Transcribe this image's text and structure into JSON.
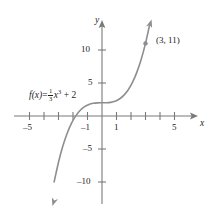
{
  "chart_data": {
    "type": "line",
    "title": "",
    "function_label": "f(x) = 1/3 x^3 + 2",
    "equation_parts": {
      "fx": "f(x)",
      "equals": "=",
      "numerator": "1",
      "denominator": "3",
      "variable": "x",
      "exponent": "3",
      "plus_constant": "+ 2"
    },
    "xlabel": "x",
    "ylabel": "y",
    "xlim": [
      -5.9,
      5.9
    ],
    "ylim": [
      -13.5,
      13.5
    ],
    "x_tick_values": [
      -5,
      -4,
      -3,
      -2,
      -1,
      1,
      2,
      3,
      4,
      5
    ],
    "x_tick_labels": [
      {
        "value": -5,
        "text": "–5"
      },
      {
        "value": -1,
        "text": "–1"
      },
      {
        "value": 1,
        "text": "1"
      },
      {
        "value": 5,
        "text": "5"
      }
    ],
    "y_tick_values": [
      -10,
      -5,
      5,
      10
    ],
    "y_tick_labels": [
      {
        "value": 10,
        "text": "10"
      },
      {
        "value": 5,
        "text": "5"
      },
      {
        "value": -5,
        "text": "–5"
      },
      {
        "value": -10,
        "text": "–10"
      }
    ],
    "grid": false,
    "legend": "none",
    "curve_color": "#8e8e8e",
    "axis_color": "#7a7a7a",
    "text_color": "#1d1d1d",
    "annotations": [
      {
        "name": "marked-point",
        "x": 3,
        "y": 11,
        "text": "(3, 11)",
        "marker": "dot"
      }
    ],
    "x": [
      -3.3,
      -3.0,
      -2.7,
      -2.4,
      -2.1,
      -1.8,
      -1.5,
      -1.2,
      -0.9,
      -0.6,
      -0.3,
      0.0,
      0.3,
      0.6,
      0.9,
      1.2,
      1.5,
      1.8,
      2.1,
      2.4,
      2.7,
      3.0,
      3.3
    ],
    "y": [
      -9.98,
      -7.0,
      -4.56,
      -2.61,
      -1.09,
      0.06,
      0.88,
      1.42,
      1.76,
      1.93,
      1.99,
      2.0,
      2.01,
      2.07,
      2.24,
      2.58,
      3.13,
      3.94,
      5.09,
      6.61,
      8.56,
      11.0,
      13.98
    ]
  }
}
